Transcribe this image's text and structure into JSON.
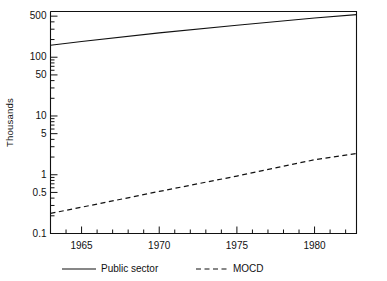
{
  "chart_data": {
    "type": "line",
    "title": "",
    "subtitle": "",
    "xlabel": "",
    "ylabel": "Thousands",
    "yscale": "log",
    "ylim": [
      0.1,
      600
    ],
    "xlim": [
      1963,
      1982.7
    ],
    "grid": false,
    "legend_position": "bottom",
    "y_tick_labels": [
      "500",
      "100",
      "50",
      "10",
      "5",
      "1",
      "0.5",
      "0.1"
    ],
    "y_tick_values": [
      500,
      100,
      50,
      10,
      5,
      1,
      0.5,
      0.1
    ],
    "x_tick_labels": [
      "1965",
      "1970",
      "1975",
      "1980"
    ],
    "x_tick_values": [
      1965,
      1970,
      1975,
      1980
    ],
    "x_minor_tick_interval": 1,
    "series": [
      {
        "name": "Public sector",
        "style": "solid",
        "color": "#111111",
        "x": [
          1963,
          1965,
          1970,
          1975,
          1980,
          1982.7
        ],
        "values": [
          160,
          185,
          260,
          350,
          465,
          530
        ]
      },
      {
        "name": "MOCD",
        "style": "dashed",
        "color": "#111111",
        "x": [
          1963,
          1965,
          1970,
          1975,
          1980,
          1982.7
        ],
        "values": [
          0.22,
          0.28,
          0.52,
          0.95,
          1.8,
          2.3
        ]
      }
    ]
  },
  "legend": {
    "entries": [
      {
        "label": "Public sector",
        "style": "solid"
      },
      {
        "label": "MOCD",
        "style": "dashed"
      }
    ]
  },
  "axis": {
    "y_title": "Thousands"
  }
}
